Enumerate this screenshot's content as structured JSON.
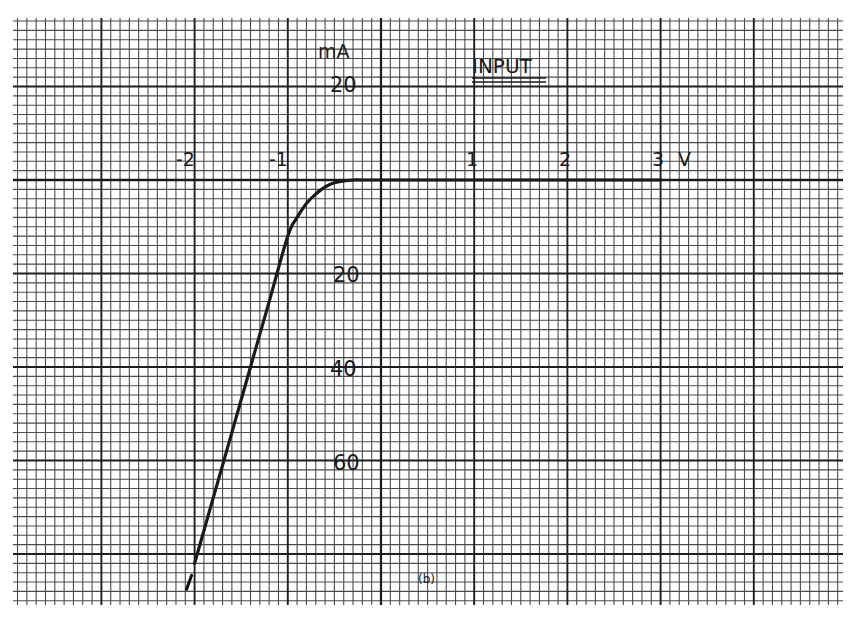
{
  "chart_data": {
    "type": "line",
    "title": "INPUT",
    "subtitle": "",
    "caption": "(b)",
    "xlabel": "V",
    "ylabel": "mA",
    "x_ticks": [
      "-2",
      "-1",
      "1",
      "2",
      "3"
    ],
    "y_ticks_positive": [
      "20"
    ],
    "y_ticks_negative": [
      "20",
      "40",
      "60"
    ],
    "xlim": [
      -2.0,
      4.0
    ],
    "ylim": [
      -90,
      32
    ],
    "grid": true,
    "grid_style": "graph paper, 10 minor divisions per major (1 V / 20 mA)",
    "legend": null,
    "series": [
      {
        "name": "Input characteristic",
        "x": [
          -2.0,
          -1.8,
          -1.6,
          -1.4,
          -1.2,
          -1.0,
          -0.9,
          -0.8,
          -0.7,
          -0.6,
          -0.5,
          -0.4,
          -0.3,
          -0.2,
          0,
          1,
          2,
          3
        ],
        "y": [
          -82,
          -68,
          -54,
          -40,
          -26,
          -12,
          -8,
          -5,
          -3,
          -1.5,
          -0.6,
          -0.2,
          0,
          0,
          0,
          0,
          0,
          0
        ]
      }
    ],
    "annotations": [
      {
        "text": "mA",
        "at": "top of y-axis"
      },
      {
        "text": "INPUT",
        "style": "double-underlined"
      },
      {
        "text": "(b)",
        "at": "bottom center"
      }
    ]
  },
  "labels": {
    "unit_y": "mA",
    "unit_x": "V",
    "title": "INPUT",
    "caption": "(b)",
    "x_neg2": "-2",
    "x_neg1": "-1",
    "x_1": "1",
    "x_2": "2",
    "x_3": "3",
    "y_pos20": "20",
    "y_neg20": "20",
    "y_neg40": "40",
    "y_neg60": "60"
  },
  "colors": {
    "paper": "#ffffff",
    "ink": "#1a1a1a",
    "grid_minor": "#4a4a4a",
    "grid_major": "#1e1e1e"
  }
}
